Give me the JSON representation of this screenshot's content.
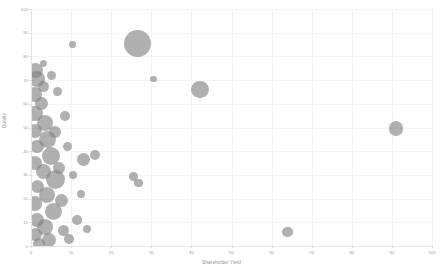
{
  "chart_data": {
    "type": "scatter",
    "title": "",
    "subtitle": "",
    "xlabel": "Shareholder Yield",
    "ylabel": "Quality",
    "xlim": [
      0,
      100
    ],
    "ylim": [
      0,
      100
    ],
    "xticks": [
      0,
      10,
      20,
      30,
      40,
      50,
      60,
      70,
      80,
      90,
      100
    ],
    "yticks": [
      0,
      10,
      20,
      30,
      40,
      50,
      60,
      70,
      80,
      90,
      100
    ],
    "grid": true,
    "legend": "none",
    "marker_style": "bubble",
    "marker_color": "#808080",
    "marker_opacity": 0.62,
    "series": [
      {
        "name": "Holdings",
        "points": [
          {
            "x": 26.5,
            "y": 85.5,
            "size": 27.5
          },
          {
            "x": 10.3,
            "y": 85.0,
            "size": 6.5
          },
          {
            "x": 30.5,
            "y": 70.5,
            "size": 6.8
          },
          {
            "x": 42.2,
            "y": 66.0,
            "size": 17.5
          },
          {
            "x": 91.0,
            "y": 49.5,
            "size": 14.5
          },
          {
            "x": 64.0,
            "y": 6.0,
            "size": 10.5
          },
          {
            "x": 16.0,
            "y": 38.5,
            "size": 10.0
          },
          {
            "x": 13.0,
            "y": 36.5,
            "size": 13.0
          },
          {
            "x": 25.5,
            "y": 29.5,
            "size": 9.0
          },
          {
            "x": 26.8,
            "y": 26.5,
            "size": 8.5
          },
          {
            "x": 1.0,
            "y": 74.0,
            "size": 15.0
          },
          {
            "x": 1.5,
            "y": 70.5,
            "size": 16.0
          },
          {
            "x": 3.0,
            "y": 67.5,
            "size": 11.0
          },
          {
            "x": 1.0,
            "y": 64.0,
            "size": 14.5
          },
          {
            "x": 2.5,
            "y": 60.0,
            "size": 13.0
          },
          {
            "x": 1.0,
            "y": 56.0,
            "size": 15.5
          },
          {
            "x": 3.5,
            "y": 52.0,
            "size": 16.5
          },
          {
            "x": 1.0,
            "y": 48.5,
            "size": 14.0
          },
          {
            "x": 4.0,
            "y": 45.0,
            "size": 17.0
          },
          {
            "x": 1.5,
            "y": 42.0,
            "size": 13.5
          },
          {
            "x": 5.0,
            "y": 38.0,
            "size": 18.0
          },
          {
            "x": 1.0,
            "y": 35.0,
            "size": 14.0
          },
          {
            "x": 3.0,
            "y": 31.5,
            "size": 15.0
          },
          {
            "x": 6.0,
            "y": 28.0,
            "size": 19.0
          },
          {
            "x": 1.5,
            "y": 25.0,
            "size": 13.0
          },
          {
            "x": 4.0,
            "y": 21.5,
            "size": 16.0
          },
          {
            "x": 1.0,
            "y": 18.0,
            "size": 14.5
          },
          {
            "x": 5.5,
            "y": 14.5,
            "size": 17.0
          },
          {
            "x": 1.5,
            "y": 11.0,
            "size": 13.5
          },
          {
            "x": 3.5,
            "y": 8.0,
            "size": 15.5
          },
          {
            "x": 1.0,
            "y": 5.0,
            "size": 13.0
          },
          {
            "x": 4.5,
            "y": 2.5,
            "size": 14.0
          },
          {
            "x": 8.0,
            "y": 6.5,
            "size": 11.0
          },
          {
            "x": 9.5,
            "y": 3.0,
            "size": 9.5
          },
          {
            "x": 7.0,
            "y": 33.0,
            "size": 12.0
          },
          {
            "x": 8.5,
            "y": 55.0,
            "size": 10.0
          },
          {
            "x": 6.5,
            "y": 65.0,
            "size": 9.0
          },
          {
            "x": 2.0,
            "y": 1.0,
            "size": 12.0
          },
          {
            "x": 7.5,
            "y": 19.0,
            "size": 13.0
          },
          {
            "x": 6.0,
            "y": 48.0,
            "size": 11.5
          },
          {
            "x": 9.0,
            "y": 42.0,
            "size": 9.0
          },
          {
            "x": 10.5,
            "y": 30.0,
            "size": 8.0
          },
          {
            "x": 11.5,
            "y": 11.0,
            "size": 9.5
          },
          {
            "x": 12.5,
            "y": 22.0,
            "size": 8.5
          },
          {
            "x": 14.0,
            "y": 7.0,
            "size": 8.0
          },
          {
            "x": 5.0,
            "y": 72.0,
            "size": 9.0
          },
          {
            "x": 3.0,
            "y": 77.0,
            "size": 7.0
          }
        ]
      }
    ]
  },
  "axes": {
    "x_title": "Shareholder Yield",
    "y_title": "Quality",
    "x_tick_labels": [
      "0",
      "10",
      "20",
      "30",
      "40",
      "50",
      "60",
      "70",
      "80",
      "90",
      "100"
    ],
    "y_tick_labels": [
      "0",
      "10",
      "20",
      "30",
      "40",
      "50",
      "60",
      "70",
      "80",
      "90",
      "100"
    ]
  },
  "colors": {
    "bubble": "#808080",
    "gridline": "#f4f4f4",
    "axis_line": "#e3e3e3",
    "tick_text": "#9d9d9d",
    "title_text": "#8f8f8f",
    "background": "#ffffff"
  }
}
